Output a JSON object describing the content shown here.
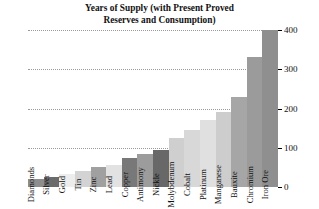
{
  "chart_data": {
    "type": "bar",
    "title": "Years of Supply (with Present Proved Reserves and Consumption)",
    "title_line1": "Years of Supply (with Present Proved",
    "title_line2": "Reserves and Consumption)",
    "xlabel": "",
    "ylabel": "",
    "ylim": [
      0,
      400
    ],
    "yticks": [
      0,
      100,
      200,
      300,
      400
    ],
    "ytick_labels": [
      "0",
      "100",
      "200",
      "300",
      "400"
    ],
    "grid": true,
    "grid_style": "dotted",
    "legend": "none",
    "axis_position": "right",
    "categories": [
      "Diamonds",
      "Silver",
      "Gold",
      "Tin",
      "Zinc",
      "Lead",
      "Copper",
      "Antimony",
      "Nickle",
      "Molybdenum",
      "Cobalt",
      "Platinum",
      "Manganese",
      "Bauxite",
      "Chromium",
      "Iron Ore"
    ],
    "values": [
      20,
      25,
      32,
      42,
      50,
      55,
      75,
      85,
      95,
      125,
      145,
      170,
      190,
      230,
      330,
      400
    ],
    "bar_colors": [
      "#8d8d8d",
      "#6b6b6b",
      "#ededed",
      "#d3d3d3",
      "#a0a0a0",
      "#e2e2e2",
      "#787878",
      "#9c9c9c",
      "#686868",
      "#cfcfcf",
      "#d8d8d8",
      "#e0e0e0",
      "#cdcdcd",
      "#a6a6a6",
      "#9b9b9b",
      "#8f8f8f"
    ]
  },
  "colors": {
    "background": "#ffffff",
    "text": "#111111",
    "axis": "#000000",
    "gridline": "#9a9a9a"
  }
}
